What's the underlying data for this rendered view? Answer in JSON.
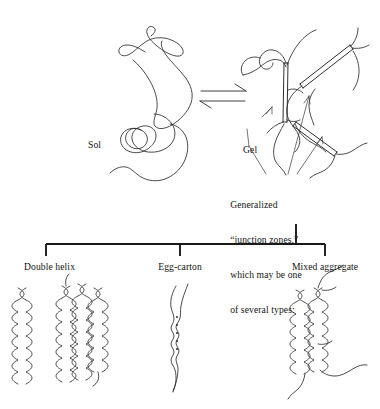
{
  "figure": {
    "type": "diagram",
    "labels": {
      "sol": "Sol",
      "gel": "Gel",
      "equilibrium_symbol": "equilibrium-double-arrow"
    },
    "caption": {
      "line1": "Generalized",
      "line2": "“junction zones,”",
      "line3": "which may be one",
      "line4": "of several types:"
    },
    "branches": [
      {
        "label": "Double helix"
      },
      {
        "label": "Egg-carton"
      },
      {
        "label": "Mixed aggregate"
      }
    ],
    "colors": {
      "ink": "#2b2b2b",
      "bracket": "#1a1a1a",
      "background": "#ffffff",
      "text": "#141414"
    }
  }
}
